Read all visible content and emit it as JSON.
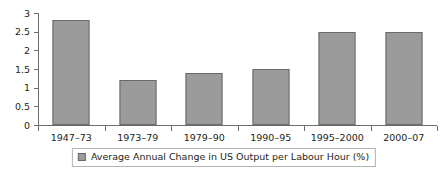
{
  "chart_data": {
    "type": "bar",
    "title": "",
    "subtitle": "",
    "xlabel": "",
    "ylabel": "",
    "categories": [
      "1947–73",
      "1973–79",
      "1979–90",
      "1990–95",
      "1995–2000",
      "2000–07"
    ],
    "values": [
      2.8,
      1.2,
      1.4,
      1.5,
      2.5,
      2.5
    ],
    "series": [
      {
        "name": "Average Annual Change in US Output per Labour Hour (%)",
        "values": [
          2.8,
          1.2,
          1.4,
          1.5,
          2.5,
          2.5
        ]
      }
    ],
    "ylim": [
      0,
      3
    ],
    "ytick_values": [
      0,
      0.5,
      1,
      1.5,
      2,
      2.5,
      3
    ],
    "ytick_labels": [
      "0",
      "0.5",
      "1",
      "1.5",
      "2",
      "2.5",
      "3"
    ],
    "grid": false,
    "legend_position": "bottom-center",
    "legend": [
      "Average Annual Change in US Output per Labour Hour (%)"
    ],
    "annotations": [],
    "colors": {
      "bar_fill": "#9b9b9b",
      "bar_border": "#6a6a6a",
      "axis": "#6e6e6e",
      "text": "#231f20",
      "background": "#ffffff",
      "legend_border": "#b5b5b5"
    }
  },
  "legend": {
    "entry_label": "Average Annual Change in US Output per Labour Hour (%)"
  }
}
